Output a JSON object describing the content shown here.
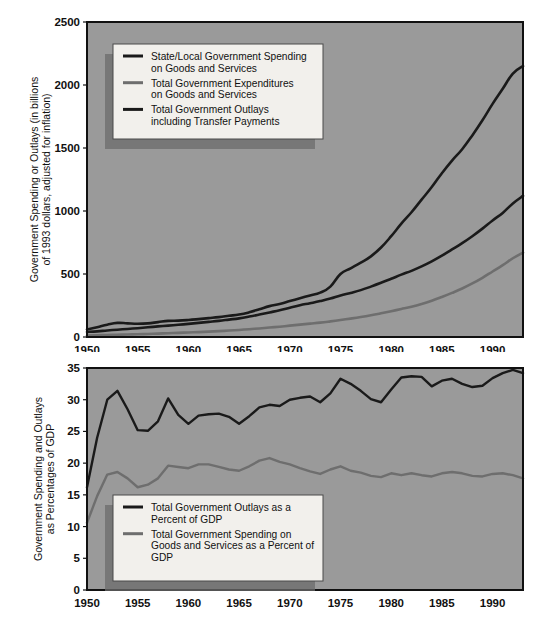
{
  "chart_data": [
    {
      "id": "top",
      "type": "line",
      "title": "",
      "xlabel": "",
      "ylabel": "Government Spending or Outlays (in billions of 1993 dollars, adjusted for inflation)",
      "ylabel_line1": "Government Spending or Outlays (in billions",
      "ylabel_line2": "of 1993 dollars, adjusted for inflation)",
      "xlim": [
        1950,
        1993
      ],
      "ylim": [
        0,
        2500
      ],
      "yticks": [
        0,
        500,
        1000,
        1500,
        2000,
        2500
      ],
      "xticks": [
        1950,
        1955,
        1960,
        1965,
        1970,
        1975,
        1980,
        1985,
        1990
      ],
      "grid": false,
      "legend_position": "upper-left-inside",
      "background": "#9a9a9a",
      "series": [
        {
          "name": "State/Local Government Spending on Goods and Services",
          "label_line1": "State/Local Government Spending",
          "label_line2": "on Goods and Services",
          "color": "#1a1a1a",
          "x": [
            1950,
            1951,
            1952,
            1953,
            1954,
            1955,
            1956,
            1957,
            1958,
            1959,
            1960,
            1961,
            1962,
            1963,
            1964,
            1965,
            1966,
            1967,
            1968,
            1969,
            1970,
            1971,
            1972,
            1973,
            1974,
            1975,
            1976,
            1977,
            1978,
            1979,
            1980,
            1981,
            1982,
            1983,
            1984,
            1985,
            1986,
            1987,
            1988,
            1989,
            1990,
            1991,
            1992,
            1993
          ],
          "values": [
            40,
            45,
            52,
            58,
            64,
            70,
            77,
            84,
            90,
            97,
            104,
            112,
            120,
            128,
            138,
            148,
            162,
            178,
            195,
            212,
            232,
            252,
            268,
            285,
            305,
            330,
            350,
            372,
            400,
            430,
            462,
            495,
            525,
            560,
            600,
            645,
            695,
            745,
            800,
            860,
            925,
            985,
            1060,
            1120
          ]
        },
        {
          "name": "Total Government Expenditures on Goods and Services",
          "label_line1": "Total Government Expenditures",
          "label_line2": "on Goods and Services",
          "color": "#6e6e6e",
          "x": [
            1950,
            1951,
            1952,
            1953,
            1954,
            1955,
            1956,
            1957,
            1958,
            1959,
            1960,
            1961,
            1962,
            1963,
            1964,
            1965,
            1966,
            1967,
            1968,
            1969,
            1970,
            1971,
            1972,
            1973,
            1974,
            1975,
            1976,
            1977,
            1978,
            1979,
            1980,
            1981,
            1982,
            1983,
            1984,
            1985,
            1986,
            1987,
            1988,
            1989,
            1990,
            1991,
            1992,
            1993
          ],
          "values": [
            12,
            14,
            16,
            18,
            20,
            22,
            24,
            27,
            30,
            33,
            36,
            39,
            43,
            47,
            51,
            56,
            62,
            68,
            75,
            82,
            90,
            98,
            106,
            114,
            124,
            135,
            146,
            158,
            172,
            188,
            205,
            222,
            240,
            262,
            288,
            318,
            350,
            385,
            425,
            470,
            520,
            570,
            625,
            670
          ]
        },
        {
          "name": "Total Government Outlays including Transfer Payments",
          "label_line1": "Total Government Outlays",
          "label_line2": "including Transfer Payments",
          "color": "#1a1a1a",
          "x": [
            1950,
            1951,
            1952,
            1953,
            1954,
            1955,
            1956,
            1957,
            1958,
            1959,
            1960,
            1961,
            1962,
            1963,
            1964,
            1965,
            1966,
            1967,
            1968,
            1969,
            1970,
            1971,
            1972,
            1973,
            1974,
            1975,
            1976,
            1977,
            1978,
            1979,
            1980,
            1981,
            1982,
            1983,
            1984,
            1985,
            1986,
            1987,
            1988,
            1989,
            1990,
            1991,
            1992,
            1993
          ],
          "values": [
            60,
            78,
            98,
            112,
            108,
            105,
            108,
            118,
            128,
            130,
            135,
            142,
            150,
            158,
            168,
            178,
            196,
            220,
            245,
            262,
            285,
            308,
            330,
            352,
            400,
            500,
            545,
            590,
            640,
            710,
            800,
            900,
            990,
            1090,
            1190,
            1300,
            1400,
            1490,
            1600,
            1720,
            1850,
            1970,
            2090,
            2150
          ]
        }
      ]
    },
    {
      "id": "bottom",
      "type": "line",
      "title": "",
      "xlabel": "",
      "ylabel": "Government Spending and Outlays as Percentages of GDP",
      "ylabel_line1": "Government Spending and Outlays",
      "ylabel_line2": "as Percentages of GDP",
      "xlim": [
        1950,
        1993
      ],
      "ylim": [
        0,
        35
      ],
      "yticks": [
        0,
        5,
        10,
        15,
        20,
        25,
        30,
        35
      ],
      "xticks": [
        1950,
        1955,
        1960,
        1965,
        1970,
        1975,
        1980,
        1985,
        1990
      ],
      "grid": false,
      "legend_position": "lower-left-inside",
      "background": "#9a9a9a",
      "series": [
        {
          "name": "Total Government Outlays as a Percent of GDP",
          "label_line1": "Total Government Outlays as a",
          "label_line2": "Percent of GDP",
          "color": "#1a1a1a",
          "x": [
            1950,
            1951,
            1952,
            1953,
            1954,
            1955,
            1956,
            1957,
            1958,
            1959,
            1960,
            1961,
            1962,
            1963,
            1964,
            1965,
            1966,
            1967,
            1968,
            1969,
            1970,
            1971,
            1972,
            1973,
            1974,
            1975,
            1976,
            1977,
            1978,
            1979,
            1980,
            1981,
            1982,
            1983,
            1984,
            1985,
            1986,
            1987,
            1988,
            1989,
            1990,
            1991,
            1992,
            1993
          ],
          "values": [
            16.2,
            24.0,
            30.0,
            31.4,
            28.5,
            25.2,
            25.1,
            26.6,
            30.2,
            27.6,
            26.2,
            27.5,
            27.7,
            27.8,
            27.3,
            26.2,
            27.4,
            28.8,
            29.2,
            29.0,
            30.0,
            30.3,
            30.5,
            29.6,
            31.0,
            33.3,
            32.5,
            31.4,
            30.1,
            29.6,
            31.6,
            33.5,
            33.7,
            33.6,
            32.1,
            33.0,
            33.3,
            32.5,
            32.0,
            32.2,
            33.4,
            34.2,
            34.7,
            34.2
          ]
        },
        {
          "name": "Total Government Spending on Goods and Services as a Percent of GDP",
          "label_line1": "Total Government Spending on",
          "label_line2": "Goods and Services as a Percent of",
          "label_line3": "GDP",
          "color": "#6e6e6e",
          "x": [
            1950,
            1951,
            1952,
            1953,
            1954,
            1955,
            1956,
            1957,
            1958,
            1959,
            1960,
            1961,
            1962,
            1963,
            1964,
            1965,
            1966,
            1967,
            1968,
            1969,
            1970,
            1971,
            1972,
            1973,
            1974,
            1975,
            1976,
            1977,
            1978,
            1979,
            1980,
            1981,
            1982,
            1983,
            1984,
            1985,
            1986,
            1987,
            1988,
            1989,
            1990,
            1991,
            1992,
            1993
          ],
          "values": [
            10.6,
            14.8,
            18.2,
            18.6,
            17.6,
            16.2,
            16.6,
            17.6,
            19.6,
            19.4,
            19.2,
            19.8,
            19.8,
            19.4,
            19.0,
            18.8,
            19.5,
            20.4,
            20.8,
            20.2,
            19.8,
            19.2,
            18.7,
            18.3,
            19.0,
            19.5,
            18.8,
            18.5,
            18.0,
            17.8,
            18.4,
            18.1,
            18.4,
            18.1,
            17.9,
            18.4,
            18.6,
            18.4,
            18.0,
            17.9,
            18.3,
            18.4,
            18.1,
            17.6
          ]
        }
      ]
    }
  ],
  "top_chart": {
    "legend": {
      "items": [
        {
          "label_line1": "State/Local Government Spending",
          "label_line2": "on Goods and Services",
          "color": "#1a1a1a"
        },
        {
          "label_line1": "Total Government Expenditures",
          "label_line2": "on Goods and Services",
          "color": "#6e6e6e"
        },
        {
          "label_line1": "Total Government Outlays",
          "label_line2": "including Transfer Payments",
          "color": "#1a1a1a"
        }
      ]
    },
    "ylabel_line1": "Government Spending or Outlays (in billions",
    "ylabel_line2": "of 1993 dollars, adjusted for inflation)",
    "yticks": [
      "0",
      "500",
      "1000",
      "1500",
      "2000",
      "2500"
    ],
    "xticks": [
      "1950",
      "1955",
      "1960",
      "1965",
      "1970",
      "1975",
      "1980",
      "1985",
      "1990"
    ]
  },
  "bottom_chart": {
    "legend": {
      "items": [
        {
          "label_line1": "Total Government Outlays as a",
          "label_line2": "Percent of GDP",
          "label_line3": "",
          "color": "#1a1a1a"
        },
        {
          "label_line1": "Total Government Spending on",
          "label_line2": "Goods and Services as a Percent of",
          "label_line3": "GDP",
          "color": "#6e6e6e"
        }
      ]
    },
    "ylabel_line1": "Government Spending and Outlays",
    "ylabel_line2": "as Percentages of GDP",
    "yticks": [
      "0",
      "5",
      "10",
      "15",
      "20",
      "25",
      "30",
      "35"
    ],
    "xticks": [
      "1950",
      "1955",
      "1960",
      "1965",
      "1970",
      "1975",
      "1980",
      "1985",
      "1990"
    ]
  },
  "colors": {
    "plot_background": "#9a9a9a",
    "dark_line": "#1a1a1a",
    "gray_line": "#6e6e6e",
    "legend_background": "#f2f0ec",
    "legend_shadow": "#6b6b6b",
    "border": "#111111",
    "page_background": "#ffffff"
  }
}
